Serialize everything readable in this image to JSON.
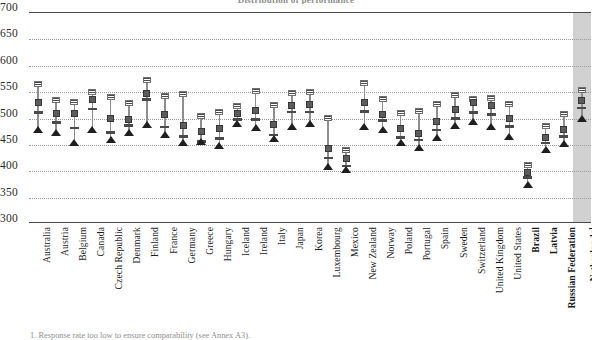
{
  "chart_data": {
    "type": "scatter",
    "title": "Distribution of performance",
    "footnote": "1. Response rate too low to ensure comparability (see Annex A3).",
    "ylabel": "",
    "xlabel": "",
    "ylim": [
      300,
      700
    ],
    "yticks": [
      300,
      350,
      400,
      450,
      500,
      550,
      600,
      650,
      700
    ],
    "grid": true,
    "legend_position": "none",
    "highlight_note": "Netherlands shown on shaded background (footnote 1)",
    "categories": [
      "Australia",
      "Austria",
      "Belgium",
      "Canada",
      "Czech Republic",
      "Denmark",
      "Finland",
      "France",
      "Germany",
      "Greece",
      "Hungary",
      "Iceland",
      "Ireland",
      "Italy",
      "Japan",
      "Korea",
      "Luxembourg",
      "Mexico",
      "New Zealand",
      "Norway",
      "Poland",
      "Portugal",
      "Spain",
      "Sweden",
      "Switzerland",
      "United Kingdom",
      "United States",
      "Brazil",
      "Latvia",
      "Russian Federation",
      "Netherlands"
    ],
    "category_styles": [
      "oecd",
      "oecd",
      "oecd",
      "oecd",
      "oecd",
      "oecd",
      "oecd",
      "oecd",
      "oecd",
      "oecd",
      "oecd",
      "oecd",
      "oecd",
      "oecd",
      "oecd",
      "oecd",
      "oecd",
      "oecd",
      "oecd",
      "oecd",
      "oecd",
      "oecd",
      "oecd",
      "oecd",
      "oecd",
      "oecd",
      "oecd",
      "partner",
      "partner",
      "partner",
      "shaded"
    ],
    "category_superscripts": [
      "",
      "",
      "",
      "",
      "",
      "",
      "",
      "",
      "",
      "",
      "",
      "",
      "",
      "",
      "",
      "",
      "",
      "",
      "",
      "",
      "",
      "",
      "",
      "",
      "",
      "",
      "",
      "",
      "",
      "",
      "1"
    ],
    "series": [
      {
        "name": "Upper marker (striped)",
        "marker": "striped",
        "values": [
          563,
          534,
          530,
          548,
          538,
          528,
          572,
          540,
          545,
          503,
          511,
          522,
          551,
          524,
          547,
          548,
          500,
          439,
          566,
          535,
          509,
          512,
          525,
          542,
          535,
          537,
          526,
          410,
          484,
          506,
          553
        ]
      },
      {
        "name": "Mean score (dark square)",
        "marker": "square",
        "values": [
          528,
          507,
          507,
          534,
          498,
          497,
          546,
          505,
          484,
          474,
          480,
          507,
          513,
          487,
          522,
          525,
          441,
          422,
          529,
          505,
          479,
          470,
          493,
          516,
          529,
          523,
          499,
          396,
          463,
          478,
          532
        ]
      },
      {
        "name": "Lower marker (dash)",
        "marker": "dash",
        "values": [
          511,
          492,
          482,
          518,
          473,
          487,
          536,
          484,
          466,
          456,
          462,
          498,
          498,
          469,
          512,
          512,
          425,
          410,
          513,
          496,
          464,
          459,
          478,
          500,
          511,
          508,
          485,
          388,
          454,
          466,
          520
        ]
      },
      {
        "name": "Lowest bound (triangle)",
        "marker": "triangle",
        "values": [
          475,
          468,
          450,
          475,
          456,
          468,
          483,
          465,
          449,
          451,
          445,
          485,
          478,
          458,
          480,
          485,
          404,
          399,
          481,
          474,
          450,
          441,
          459,
          482,
          490,
          481,
          462,
          370,
          436,
          448,
          496
        ]
      }
    ]
  }
}
